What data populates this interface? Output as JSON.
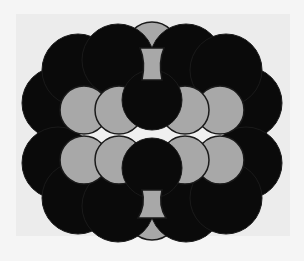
{
  "figure": {
    "colors": {
      "background": "#f5f5f5",
      "panel": "#ececec",
      "dark_atom": "#0a0a0a",
      "light_atom": "#a8a8a8",
      "outline": "#1a1a1a",
      "void": "#f0f0f0"
    },
    "atom_types": [
      {
        "name": "dark",
        "color": "#0a0a0a"
      },
      {
        "name": "light",
        "color": "#a8a8a8"
      }
    ]
  }
}
